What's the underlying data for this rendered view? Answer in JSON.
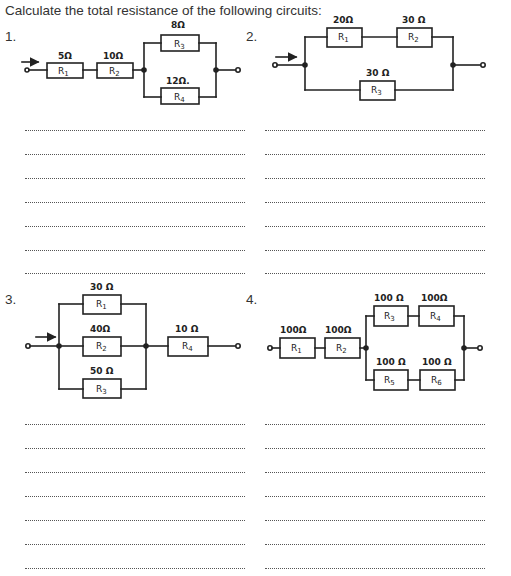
{
  "title": "Calculate the total resistance of the following circuits:",
  "questions": [
    {
      "number": "1.",
      "topology": "R1 series R2 series (R3 parallel R4)",
      "resistors": [
        {
          "label": "R1",
          "value": "5 Ω"
        },
        {
          "label": "R2",
          "value": "10 Ω"
        },
        {
          "label": "R3",
          "value": "8 Ω"
        },
        {
          "label": "R4",
          "value": "12 Ω."
        }
      ],
      "answer_lines": 7
    },
    {
      "number": "2.",
      "topology": "(R1 series R2) parallel R3",
      "resistors": [
        {
          "label": "R1",
          "value": "20 Ω"
        },
        {
          "label": "R2",
          "value": "30 Ω"
        },
        {
          "label": "R3",
          "value": "30 Ω"
        }
      ],
      "answer_lines": 7
    },
    {
      "number": "3.",
      "topology": "(R1 parallel R2 parallel R3) series R4",
      "resistors": [
        {
          "label": "R1",
          "value": "30 Ω"
        },
        {
          "label": "R2",
          "value": "40 Ω"
        },
        {
          "label": "R3",
          "value": "50 Ω"
        },
        {
          "label": "R4",
          "value": "10 Ω"
        }
      ],
      "answer_lines": 7
    },
    {
      "number": "4.",
      "topology": "R1 series R2 series ((R3 series R4) parallel (R5 series R6))",
      "resistors": [
        {
          "label": "R1",
          "value": "100 Ω"
        },
        {
          "label": "R2",
          "value": "100 Ω"
        },
        {
          "label": "R3",
          "value": "100 Ω"
        },
        {
          "label": "R4",
          "value": "100 Ω"
        },
        {
          "label": "R5",
          "value": "100 Ω"
        },
        {
          "label": "R6",
          "value": "100 Ω"
        }
      ],
      "answer_lines": 7
    }
  ]
}
